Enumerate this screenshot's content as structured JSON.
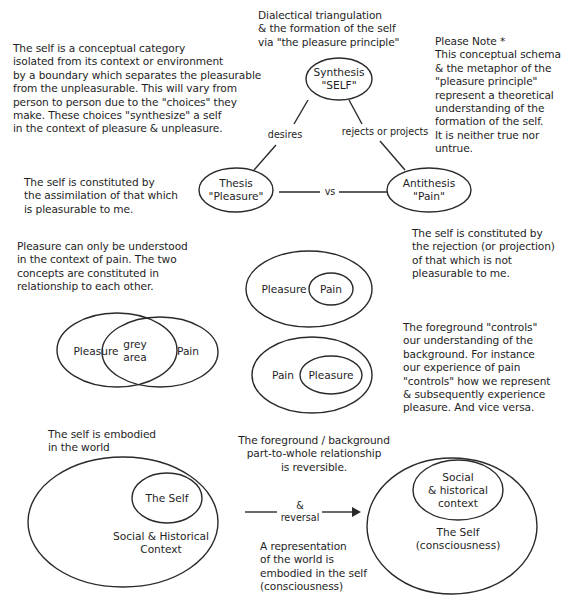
{
  "title": "Dialectical triangulation\n& the formation of the self\nvia \"the pleasure principle\"",
  "colors": {
    "ink": "#1e1e1e",
    "background": "#ffffff"
  },
  "notes": {
    "self_category": "The self is a conceptual category\nisolated from its context or environment\nby a boundary which separates the pleasurable\nfrom the unpleasurable. This will vary from\nperson to person due to the \"choices\" they\nmake. These choices \"synthesize\" a self\nin the context of pleasure & unpleasure.",
    "please_note": "Please Note *\nThis conceptual schema\n& the metaphor of the\n\"pleasure principle\"\nrepresent a theoretical\nunderstanding of the\nformation of the self.\nIt is neither true nor\nuntrue.",
    "assimilation": "The self is constituted by\nthe assimilation of that which\nis pleasurable to me.",
    "rejection": "The self is constituted by\nthe rejection (or projection)\nof that which is not\npleasurable to me.",
    "pleasure_pain_context": "Pleasure can only be understood\nin the context of pain. The two\nconcepts are constituted in\nrelationship to each other.",
    "foreground_controls": "The foreground \"controls\"\nour understanding of the\nbackground. For instance\nour experience of pain\n\"controls\" how we represent\n& subsequently experience\npleasure. And vice versa.",
    "embodied": "The self is embodied\nin the world",
    "reversible": "The foreground / background\npart-to-whole relationship\nis reversible.",
    "representation": "A representation\nof the world is\nembodied in the self\n(consciousness)"
  },
  "triangle": {
    "synthesis": "Synthesis\n\"SELF\"",
    "thesis": "Thesis\n\"Pleasure\"",
    "antithesis": "Antithesis\n\"Pain\"",
    "edge_left": "desires",
    "edge_right": "rejects or projects",
    "edge_bottom": "vs"
  },
  "venn": {
    "left": "Pleasure",
    "overlap": "grey\narea",
    "right": "Pain"
  },
  "nested_1": {
    "outer": "Pleasure",
    "inner": "Pain"
  },
  "nested_2": {
    "outer": "Pain",
    "inner": "Pleasure"
  },
  "world_left": {
    "inner": "The Self",
    "outer": "Social & Historical\nContext"
  },
  "reversal_arrow": {
    "label": "&\nreversal"
  },
  "world_right": {
    "inner": "Social\n& historical\ncontext",
    "outer": "The Self\n(consciousness)"
  }
}
